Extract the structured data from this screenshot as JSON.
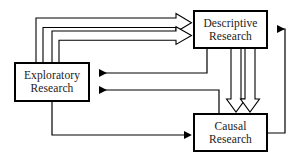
{
  "diagram": {
    "type": "flow-diagram",
    "background_color": "#ffffff",
    "line_color": "#000000",
    "text_color": "#1a1a1a",
    "nodes": [
      {
        "id": "descriptive",
        "label": "Descriptive Research",
        "line1": "Descriptive",
        "line2": "Research",
        "x": 193,
        "y": 10,
        "width": 75,
        "height": 39
      },
      {
        "id": "exploratory",
        "label": "Exploratory Research",
        "line1": "Exploratory",
        "line2": "Research",
        "x": 14,
        "y": 62,
        "width": 76,
        "height": 40
      },
      {
        "id": "causal",
        "label": "Causal Research",
        "line1": "Causal",
        "line2": "Research",
        "x": 193,
        "y": 113,
        "width": 75,
        "height": 39
      }
    ],
    "edges": [
      {
        "id": "exploratory-to-descriptive-outer",
        "from": "exploratory",
        "to": "descriptive",
        "style": "hollow-block-arrow",
        "direction": "right"
      },
      {
        "id": "exploratory-to-descriptive-inner",
        "from": "exploratory",
        "to": "descriptive",
        "style": "hollow-block-arrow",
        "direction": "right"
      },
      {
        "id": "descriptive-to-causal-left",
        "from": "descriptive",
        "to": "causal",
        "style": "hollow-block-arrow",
        "direction": "down"
      },
      {
        "id": "descriptive-to-causal-right",
        "from": "descriptive",
        "to": "causal",
        "style": "hollow-block-arrow",
        "direction": "down"
      },
      {
        "id": "descriptive-to-exploratory",
        "from": "descriptive",
        "to": "exploratory",
        "style": "thin-solid-arrow",
        "direction": "left"
      },
      {
        "id": "causal-to-exploratory",
        "from": "causal",
        "to": "exploratory",
        "style": "thin-solid-arrow",
        "direction": "left"
      },
      {
        "id": "exploratory-to-causal",
        "from": "exploratory",
        "to": "causal",
        "style": "thin-solid-arrow",
        "direction": "right"
      },
      {
        "id": "causal-to-descriptive",
        "from": "causal",
        "to": "descriptive",
        "style": "thin-solid-arrow",
        "direction": "left"
      }
    ]
  }
}
